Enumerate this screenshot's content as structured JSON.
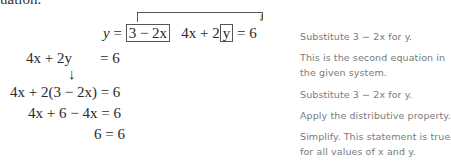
{
  "header_fragment": "uation.",
  "lines": [
    {
      "lhs": "y",
      "eq": "=",
      "boxed_expr": "3 − 2x",
      "second_eq_pre": "4x + 2",
      "second_eq_boxed": "y",
      "second_eq_post": "= 6",
      "note": "Substitute 3 − 2x for y."
    },
    {
      "lhs": "4x + 2y",
      "rhs": "= 6",
      "note_line1": "This is the second equation in",
      "note_line2": "the given system."
    },
    {
      "arrow": "↓"
    },
    {
      "expr": "4x + 2(3 − 2x) = 6",
      "note": "Substitute 3 − 2x for y."
    },
    {
      "expr": "4x + 6 − 4x = 6",
      "note": "Apply the distributive property."
    },
    {
      "expr": "6 = 6",
      "note_line1": "Simplify. This statement is true",
      "note_line2": "for all values of x and y."
    }
  ]
}
